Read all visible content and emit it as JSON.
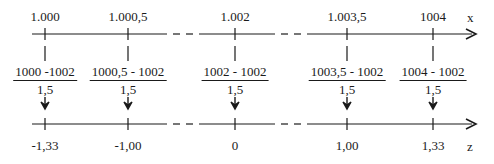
{
  "diagram": {
    "top_axis": {
      "name": "x",
      "ticks": [
        {
          "label": "1.000",
          "pos": 45
        },
        {
          "label": "1.000,5",
          "pos": 128
        },
        {
          "label": "1.002",
          "pos": 235
        },
        {
          "label": "1.003,5",
          "pos": 347
        },
        {
          "label": "1004",
          "pos": 433
        }
      ]
    },
    "fractions": [
      {
        "numerator": "1000 -1002",
        "denominator": "1,5",
        "pos": 45
      },
      {
        "numerator": "1000,5 - 1002",
        "denominator": "1,5",
        "pos": 128
      },
      {
        "numerator": "1002 - 1002",
        "denominator": "1,5",
        "pos": 235
      },
      {
        "numerator": "1003,5 - 1002",
        "denominator": "1,5",
        "pos": 347
      },
      {
        "numerator": "1004 - 1002",
        "denominator": "1,5",
        "pos": 433
      }
    ],
    "bottom_axis": {
      "name": "z",
      "ticks": [
        {
          "label": "-1,33",
          "pos": 45
        },
        {
          "label": "-1,00",
          "pos": 128
        },
        {
          "label": "0",
          "pos": 235
        },
        {
          "label": "1,00",
          "pos": 347
        },
        {
          "label": "1,33",
          "pos": 433
        }
      ]
    },
    "line_color": "#1a1a1a"
  }
}
